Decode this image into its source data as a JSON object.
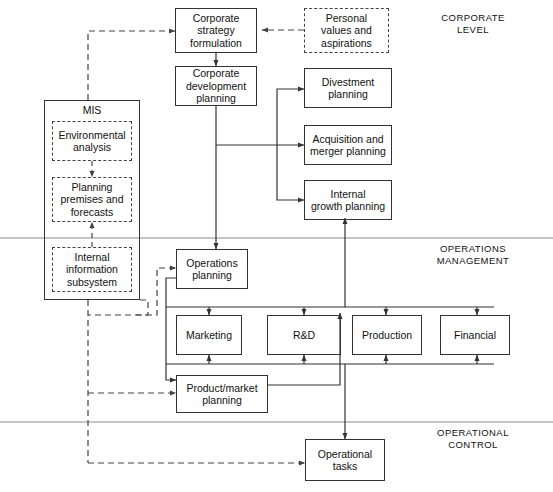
{
  "diagram": {
    "canvas": {
      "width": 553,
      "height": 492
    },
    "band_labels": [
      {
        "id": "corporate-level",
        "text": "CORPORATE\nLEVEL"
      },
      {
        "id": "operations-management",
        "text": "OPERATIONS\nMANAGEMENT"
      },
      {
        "id": "operational-control",
        "text": "OPERATIONAL\nCONTROL"
      }
    ],
    "nodes": [
      {
        "id": "corporate-strategy-formulation",
        "label": "Corporate\nstrategy\nformulation",
        "style": "solid"
      },
      {
        "id": "personal-values-and-aspirations",
        "label": "Personal\nvalues and\naspirations",
        "style": "dashed"
      },
      {
        "id": "corporate-development-planning",
        "label": "Corporate\ndevelopment\nplanning",
        "style": "solid"
      },
      {
        "id": "divestment-planning",
        "label": "Divestment\nplanning",
        "style": "solid"
      },
      {
        "id": "acquisition-and-merger-planning",
        "label": "Acquisition and\nmerger planning",
        "style": "solid"
      },
      {
        "id": "internal-growth-planning",
        "label": "Internal\ngrowth planning",
        "style": "solid"
      },
      {
        "id": "mis",
        "label": "MIS",
        "style": "solid"
      },
      {
        "id": "environmental-analysis",
        "label": "Environmental\nanalysis",
        "style": "dashed"
      },
      {
        "id": "planning-premises-and-forecasts",
        "label": "Planning\npremises and\nforecasts",
        "style": "dashed"
      },
      {
        "id": "internal-information-subsystem",
        "label": "Internal\ninformation\nsubsystem",
        "style": "dashed"
      },
      {
        "id": "operations-planning",
        "label": "Operations\nplanning",
        "style": "solid"
      },
      {
        "id": "marketing",
        "label": "Marketing",
        "style": "solid"
      },
      {
        "id": "rnd",
        "label": "R&D",
        "style": "solid"
      },
      {
        "id": "production",
        "label": "Production",
        "style": "solid"
      },
      {
        "id": "financial",
        "label": "Financial",
        "style": "solid"
      },
      {
        "id": "product-market-planning",
        "label": "Product/market\nplanning",
        "style": "solid"
      },
      {
        "id": "operational-tasks",
        "label": "Operational\ntasks",
        "style": "solid"
      }
    ],
    "colors": {
      "line": "#333333",
      "dashed_line": "#444444",
      "band_rule": "#8a8a8a",
      "text": "#111111",
      "background": "#ffffff"
    }
  }
}
